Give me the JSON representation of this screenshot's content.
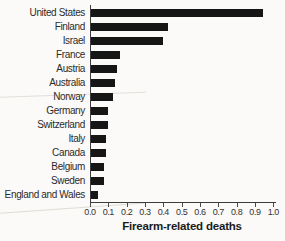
{
  "chart_data": {
    "type": "bar",
    "orientation": "horizontal",
    "title": "",
    "xlabel": "Firearm-related deaths",
    "ylabel": "",
    "xlim": [
      0,
      1.0
    ],
    "grid": false,
    "legend": false,
    "bar_color": "#161616",
    "axis_color": "#3d3d3d",
    "label_color": "#2b2b2b",
    "background_color": "#fbfaf8",
    "categories": [
      "United States",
      "Finland",
      "Israel",
      "France",
      "Austria",
      "Australia",
      "Norway",
      "Germany",
      "Switzerland",
      "Italy",
      "Canada",
      "Belgium",
      "Sweden",
      "England and Wales"
    ],
    "values": [
      0.94,
      0.42,
      0.39,
      0.16,
      0.14,
      0.13,
      0.12,
      0.09,
      0.09,
      0.08,
      0.08,
      0.07,
      0.07,
      0.04
    ],
    "xtick_labels": [
      "0.0",
      "0.1",
      "0.2",
      "0.3",
      "0.4",
      "0.5",
      "0.6",
      "0.7",
      "0.8",
      "0.9",
      "1.0"
    ]
  }
}
